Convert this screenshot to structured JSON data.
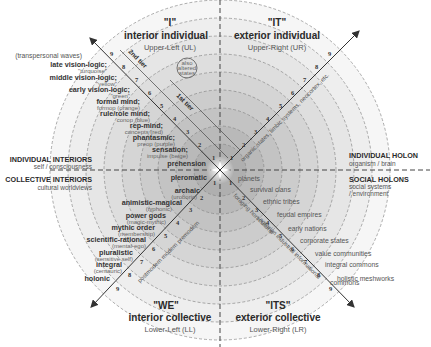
{
  "quadrants": {
    "ul": {
      "pronoun": "\"I\"",
      "title": "interior individual",
      "code": "Upper-Left (UL)"
    },
    "ur": {
      "pronoun": "\"IT\"",
      "title": "exterior individual",
      "code": "Upper-Right (UR)"
    },
    "ll": {
      "pronoun": "\"WE\"",
      "title": "interior collective",
      "code": "Lower-Left (LL)"
    },
    "lr": {
      "pronoun": "\"ITS\"",
      "title": "exterior collective",
      "code": "Lower-Right (LR)"
    }
  },
  "side_labels": {
    "individual_interiors": {
      "title": "INDIVIDUAL INTERIORS",
      "sub": "self / consciousness"
    },
    "collective_interiors": {
      "title": "COLLECTIVE INTERIORS",
      "sub": "cultural worldviews"
    },
    "individual_holon": {
      "title": "INDIVIDUAL HOLON",
      "sub": "organism / brain"
    },
    "social_holons": {
      "title": "SOCIAL HOLONS",
      "sub1": "social systems",
      "sub2": "/ environment"
    }
  },
  "ul_levels": {
    "transpersonal": "(transpersonal waves)",
    "items": [
      {
        "name": "late vision-logic;",
        "sub": "\"turquoise\""
      },
      {
        "name": "middle vision-logic;",
        "sub": "\"yellow\""
      },
      {
        "name": "early vision-logic;",
        "sub": "\"green\""
      },
      {
        "name": "formal mind;",
        "sub": "formop (orange)"
      },
      {
        "name": "rule/role mind;",
        "sub": "conop (blue)"
      },
      {
        "name": "rep-mind;",
        "sub": "concepts (red)"
      },
      {
        "name": "phantasmic;",
        "sub": "preop (purple)"
      },
      {
        "name": "sensation;",
        "sub": "impulse (beige)"
      },
      {
        "name": "prehension",
        "sub": ""
      }
    ],
    "tier2": "2nd tier",
    "tier1": "1st tier",
    "altered": [
      "also",
      "altered",
      "states"
    ]
  },
  "ll_levels": [
    {
      "name": "pleromatic",
      "sub": ""
    },
    {
      "name": "archaic",
      "sub": "(uroboric)"
    },
    {
      "name": "animistic-magical",
      "sub": "(typhonic)"
    },
    {
      "name": "power gods",
      "sub": "(magic-mythic)"
    },
    {
      "name": "mythic order",
      "sub": "(membership)"
    },
    {
      "name": "scientific-rational",
      "sub": "(mental-ego)"
    },
    {
      "name": "pluralistic",
      "sub": "(sensitive self)"
    },
    {
      "name": "integral",
      "sub": "(centauric)"
    },
    {
      "name": "holonic",
      "sub": ""
    }
  ],
  "ll_diagonal": "postmodern  modern  premodern",
  "ur_diagonal": "organic states, limbic systems, neocortex, etc.",
  "lr_levels": [
    "planets",
    "survival clans",
    "ethnic tribes",
    "feudal empires",
    "early nations",
    "corporate states",
    "value communities",
    "integral commons",
    "holistic meshworks"
  ],
  "lr_diagonal_a": "foraging  horticultural",
  "lr_diagonal_b": "agrarian  industrial  informational",
  "numbers": [
    "1",
    "2",
    "3",
    "4",
    "5",
    "6",
    "7",
    "8",
    "9"
  ],
  "colors": {
    "ring_dark": "#a9a9a9",
    "ring_light": "#f4f4f4",
    "line": "#333333",
    "dash": "#888888"
  }
}
